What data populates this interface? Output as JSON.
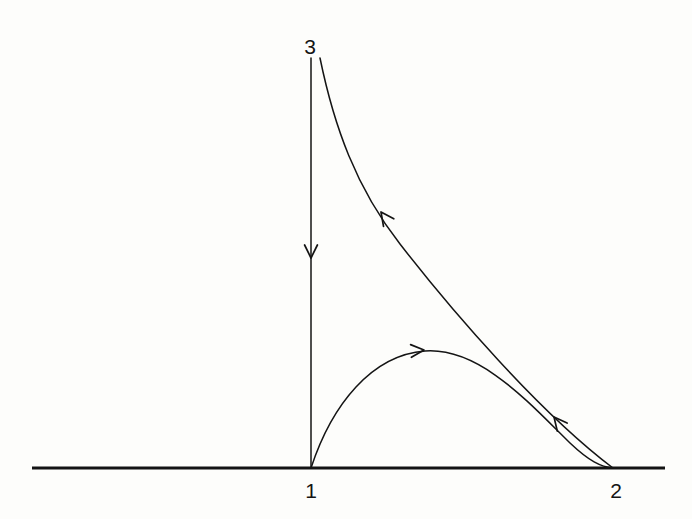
{
  "figure": {
    "kind": "phase-portrait-diagram",
    "title": "",
    "background_color": "#fdfdfb",
    "stroke_color": "#141414",
    "canvas": {
      "width": 692,
      "height": 519
    }
  },
  "labels": {
    "vertex_top": "3",
    "vertex_left": "1",
    "vertex_right": "2"
  },
  "label_positions": {
    "vertex_top": {
      "x": 310,
      "y": 46
    },
    "vertex_left": {
      "x": 311,
      "y": 490
    },
    "vertex_right": {
      "x": 616,
      "y": 490
    }
  },
  "nodes": [
    {
      "name": "node-1",
      "label": "1",
      "x": 311,
      "y": 468
    },
    {
      "name": "node-2",
      "label": "2",
      "x": 613,
      "y": 468
    },
    {
      "name": "node-3",
      "label": "3",
      "x": 311,
      "y": 58
    }
  ],
  "axis": {
    "name": "horizontal-axis",
    "x1": 32,
    "y1": 468,
    "x2": 665,
    "y2": 468,
    "stroke_width": 3.2,
    "color": "#141414"
  },
  "edges": [
    {
      "name": "edge-3-to-1",
      "from": "3",
      "to": "1",
      "path": "M 311 58 L 311 468",
      "stroke_width": 1.5,
      "arrows": [
        {
          "name": "arrow-down",
          "x": 311,
          "y": 258,
          "angle_deg": 90,
          "direction": "down"
        }
      ]
    },
    {
      "name": "edge-2-to-3",
      "from": "2",
      "to": "3",
      "path": "M 320 58 C 334 126, 356 188, 400 244 C 452 311, 540 413, 613 468",
      "stroke_width": 1.5,
      "arrows": [
        {
          "name": "arrow-up-left-upper",
          "x": 381,
          "y": 212,
          "angle_deg": 234,
          "direction": "up-left"
        },
        {
          "name": "arrow-up-left-lower",
          "x": 554,
          "y": 417,
          "angle_deg": 231,
          "direction": "up-left"
        }
      ]
    },
    {
      "name": "edge-1-to-2",
      "from": "1",
      "to": "2",
      "path": "M 311 468 C 332 404, 372 355, 425 351 C 480 347, 530 404, 570 443 C 589 461, 601 467, 613 468",
      "stroke_width": 1.5,
      "arrows": [
        {
          "name": "arrow-right",
          "x": 424,
          "y": 350,
          "angle_deg": 356,
          "direction": "right"
        }
      ]
    }
  ],
  "chart_data": {
    "type": "diagram",
    "equilibria": [
      "1",
      "2",
      "3"
    ],
    "orbits": [
      {
        "from": "3",
        "to": "1",
        "shape": "straight-vertical"
      },
      {
        "from": "1",
        "to": "2",
        "shape": "arched-convex-up"
      },
      {
        "from": "2",
        "to": "3",
        "shape": "convex-decreasing"
      }
    ],
    "axis_label": "",
    "grid": false,
    "legend": "none"
  }
}
